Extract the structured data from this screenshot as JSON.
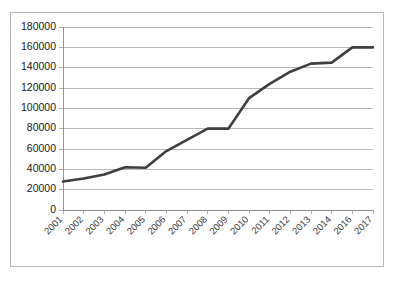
{
  "chart_data": {
    "type": "line",
    "title": "",
    "subtitle": "",
    "xlabel": "",
    "ylabel": "",
    "grid": true,
    "legend": false,
    "legend_position": "none",
    "ylim": [
      0,
      180000
    ],
    "ytick_step": 20000,
    "ytick_labels": [
      "0",
      "20000",
      "40000",
      "60000",
      "80000",
      "100000",
      "120000",
      "140000",
      "160000",
      "180000"
    ],
    "ytick_values": [
      0,
      20000,
      40000,
      60000,
      80000,
      100000,
      120000,
      140000,
      160000,
      180000
    ],
    "categories": [
      "2001",
      "2002",
      "2003",
      "2004",
      "2005",
      "2006",
      "2007",
      "2008",
      "2009",
      "2010",
      "2011",
      "2012",
      "2013",
      "2014",
      "2016",
      "2017"
    ],
    "xtick_rotation": -45,
    "series": [
      {
        "name": "",
        "color": "#3f3f3f",
        "line_width": 2.6,
        "markers": false,
        "values": [
          28000,
          31000,
          35000,
          42000,
          41500,
          58000,
          69000,
          80000,
          80000,
          110000,
          124000,
          136000,
          144000,
          145000,
          160000,
          160000
        ]
      }
    ]
  },
  "frame": {
    "border_color": "#b8b8b8",
    "background": "#ffffff"
  }
}
